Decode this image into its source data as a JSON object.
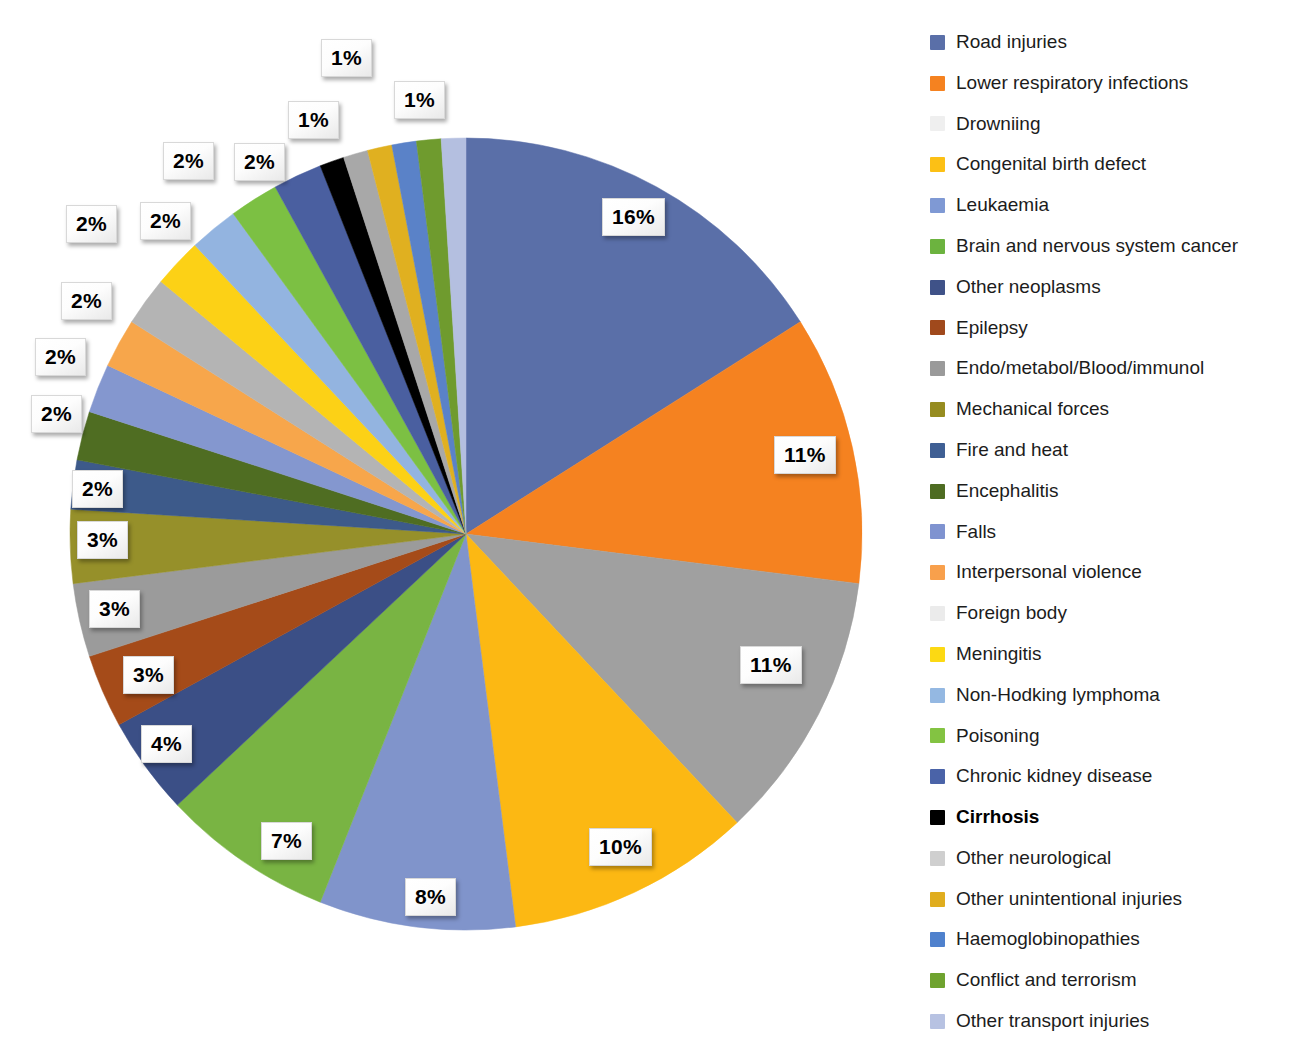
{
  "chart_data": {
    "type": "pie",
    "title": "",
    "subtitle": "",
    "xlabel": "",
    "ylabel": "",
    "legend_position": "right",
    "grid": false,
    "start_angle_deg": 0,
    "direction": "clockwise",
    "value_unit": "%",
    "categories": [
      "Road injuries",
      "Lower respiratory infections",
      "Drowniing",
      "Congenital birth defect",
      "Leukaemia",
      "Brain and nervous system cancer",
      "Other neoplasms",
      "Epilepsy",
      "Endo/metabol/Blood/immunol",
      "Mechanical forces",
      "Fire and heat",
      "Encephalitis",
      "Falls",
      "Interpersonal violence",
      "Foreign body",
      "Meningitis",
      "Non-Hodking lymphoma",
      "Poisoning",
      "Chronic kidney disease",
      "Cirrhosis",
      "Other neurological",
      "Other unintentional injuries",
      "Haemoglobinopathies",
      "Conflict and terrorism",
      "Other transport injuries"
    ],
    "values": [
      16,
      11,
      11,
      10,
      8,
      7,
      4,
      3,
      3,
      3,
      2,
      2,
      2,
      2,
      2,
      2,
      2,
      2,
      2,
      1,
      1,
      1,
      1,
      1,
      1
    ],
    "colors": [
      "#5a6fa8",
      "#f58220",
      "#a0a0a0",
      "#fcb813",
      "#8094cb",
      "#79b443",
      "#3b4f86",
      "#a54b19",
      "#9b9b9b",
      "#96902a",
      "#3d5a8a",
      "#4f6d22",
      "#8497cf",
      "#f7a64b",
      "#b4b4b4",
      "#fcd116",
      "#93b4e0",
      "#7cc043",
      "#4a5fa0",
      "#000000",
      "#a8a8a8",
      "#e0b020",
      "#5a82c8",
      "#6f9b2e",
      "#b4bfe0"
    ],
    "labels": [
      "16%",
      "11%",
      "11%",
      "10%",
      "8%",
      "7%",
      "4%",
      "3%",
      "3%",
      "3%",
      "2%",
      "2%",
      "2%",
      "2%",
      "2%",
      "2%",
      "2%",
      "2%",
      "2%",
      "1%",
      "1%",
      "1%",
      "1%",
      "1%",
      "1%"
    ]
  },
  "legend": {
    "items": [
      {
        "label": "Road injuries",
        "color": "#5a6fa8",
        "bold": false
      },
      {
        "label": "Lower respiratory infections",
        "color": "#f58220",
        "bold": false
      },
      {
        "label": "Drowniing",
        "color": "#efefef",
        "bold": false
      },
      {
        "label": "Congenital birth defect",
        "color": "#fcc015",
        "bold": false
      },
      {
        "label": "Leukaemia",
        "color": "#7f99d4",
        "bold": false
      },
      {
        "label": "Brain and nervous system cancer",
        "color": "#6cb33f",
        "bold": false
      },
      {
        "label": "Other neoplasms",
        "color": "#3f5288",
        "bold": false
      },
      {
        "label": "Epilepsy",
        "color": "#a0491c",
        "bold": false
      },
      {
        "label": "Endo/metabol/Blood/immunol",
        "color": "#9a9a9a",
        "bold": false
      },
      {
        "label": "Mechanical forces",
        "color": "#968c20",
        "bold": false
      },
      {
        "label": "Fire and heat",
        "color": "#3f5f94",
        "bold": false
      },
      {
        "label": "Encephalitis",
        "color": "#4e6c22",
        "bold": false
      },
      {
        "label": "Falls",
        "color": "#7f93d0",
        "bold": false
      },
      {
        "label": "Interpersonal violence",
        "color": "#f8a04c",
        "bold": false
      },
      {
        "label": "Foreign body",
        "color": "#ebebeb",
        "bold": false
      },
      {
        "label": "Meningitis",
        "color": "#fcd913",
        "bold": false
      },
      {
        "label": "Non-Hodking lymphoma",
        "color": "#94b8e2",
        "bold": false
      },
      {
        "label": "Poisoning",
        "color": "#83c342",
        "bold": false
      },
      {
        "label": "Chronic kidney disease",
        "color": "#4a63a8",
        "bold": false
      },
      {
        "label": "Cirrhosis",
        "color": "#000000",
        "bold": true
      },
      {
        "label": "Other neurological",
        "color": "#cfcfcf",
        "bold": false
      },
      {
        "label": "Other unintentional injuries",
        "color": "#e0ad1e",
        "bold": false
      },
      {
        "label": "Haemoglobinopathies",
        "color": "#4f81cd",
        "bold": false
      },
      {
        "label": "Conflict and terrorism",
        "color": "#6fa32f",
        "bold": false
      },
      {
        "label": "Other transport injuries",
        "color": "#b7c2e2",
        "bold": false
      }
    ]
  },
  "callouts": [
    {
      "text": "16%",
      "x": 602,
      "y": 198
    },
    {
      "text": "11%",
      "x": 774,
      "y": 436
    },
    {
      "text": "11%",
      "x": 740,
      "y": 646
    },
    {
      "text": "10%",
      "x": 589,
      "y": 828
    },
    {
      "text": "8%",
      "x": 405,
      "y": 878
    },
    {
      "text": "7%",
      "x": 261,
      "y": 822
    },
    {
      "text": "4%",
      "x": 141,
      "y": 725
    },
    {
      "text": "3%",
      "x": 123,
      "y": 656
    },
    {
      "text": "3%",
      "x": 89,
      "y": 590
    },
    {
      "text": "3%",
      "x": 77,
      "y": 521
    },
    {
      "text": "2%",
      "x": 72,
      "y": 470
    },
    {
      "text": "2%",
      "x": 31,
      "y": 395
    },
    {
      "text": "2%",
      "x": 35,
      "y": 338
    },
    {
      "text": "2%",
      "x": 61,
      "y": 282
    },
    {
      "text": "2%",
      "x": 66,
      "y": 205
    },
    {
      "text": "2%",
      "x": 140,
      "y": 202
    },
    {
      "text": "2%",
      "x": 163,
      "y": 142
    },
    {
      "text": "2%",
      "x": 234,
      "y": 143
    },
    {
      "text": "1%",
      "x": 288,
      "y": 101
    },
    {
      "text": "1%",
      "x": 321,
      "y": 39
    },
    {
      "text": "1%",
      "x": 394,
      "y": 81
    }
  ]
}
